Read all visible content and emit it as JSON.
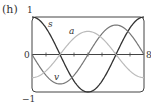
{
  "panel_label": "(h)",
  "chart_data": {
    "type": "line",
    "title": "",
    "xlabel": "",
    "ylabel": "",
    "xlim": [
      0,
      8
    ],
    "ylim": [
      -1,
      1
    ],
    "tick_labels": {
      "y_top": "1",
      "y_bottom": "−1",
      "x_left": "0",
      "x_right": "8"
    },
    "x_ticks": [
      1,
      2,
      3,
      4,
      5,
      6,
      7
    ],
    "grid": false,
    "legend": "inline labels",
    "series": [
      {
        "name": "s",
        "formula": "cos(πt/4)",
        "color": "#333333",
        "x": [
          0,
          1,
          2,
          3,
          4,
          5,
          6,
          7,
          8
        ],
        "values": [
          1,
          0.707,
          0,
          -0.707,
          -1,
          -0.707,
          0,
          0.707,
          1
        ]
      },
      {
        "name": "v",
        "formula": "-(π/4)sin(πt/4)",
        "color": "#777777",
        "x": [
          0,
          1,
          2,
          3,
          4,
          5,
          6,
          7,
          8
        ],
        "values": [
          0,
          -0.555,
          -0.785,
          -0.555,
          0,
          0.555,
          0.785,
          0.555,
          0
        ]
      },
      {
        "name": "a",
        "formula": "-(π/4)^2 cos(πt/4)",
        "color": "#bbbbbb",
        "x": [
          0,
          1,
          2,
          3,
          4,
          5,
          6,
          7,
          8
        ],
        "values": [
          -0.617,
          -0.436,
          0,
          0.436,
          0.617,
          0.436,
          0,
          -0.436,
          -0.617
        ]
      }
    ]
  }
}
